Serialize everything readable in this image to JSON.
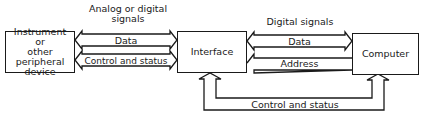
{
  "diagram": {
    "nodes": {
      "instrument": {
        "label_lines": [
          "Instrument",
          "or",
          "other peripheral",
          "device"
        ]
      },
      "interface": {
        "label": "Interface"
      },
      "computer": {
        "label": "Computer"
      }
    },
    "groups": {
      "left": {
        "title_line1": "Analog or digital",
        "title_line2": "signals"
      },
      "right": {
        "title": "Digital signals"
      }
    },
    "edges": {
      "left_data": {
        "label": "Data",
        "direction": "bidirectional",
        "from": "instrument",
        "to": "interface"
      },
      "left_control": {
        "label": "Control and status",
        "direction": "bidirectional",
        "from": "instrument",
        "to": "interface"
      },
      "right_data": {
        "label": "Data",
        "direction": "bidirectional",
        "from": "interface",
        "to": "computer"
      },
      "right_address": {
        "label": "Address",
        "direction": "computer-to-interface",
        "from": "computer",
        "to": "interface"
      },
      "bottom_control": {
        "label": "Control and status",
        "direction": "bidirectional",
        "from": "interface",
        "to": "computer"
      }
    },
    "colors": {
      "line": "#1a1a1a",
      "background": "#ffffff"
    }
  }
}
